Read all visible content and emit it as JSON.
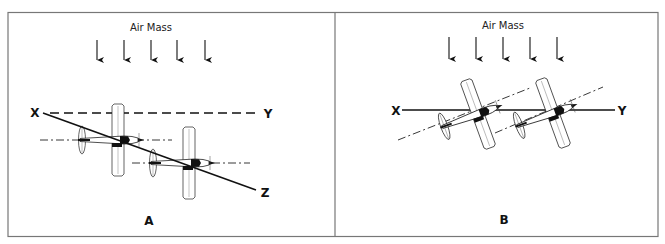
{
  "figure": {
    "panels": [
      {
        "id": "A",
        "letter": "A",
        "air_mass_label": "Air Mass",
        "arrow_count": 5,
        "axis_labels": {
          "start": "X",
          "level_end": "Y",
          "slope_end": "Z"
        },
        "lines": {
          "X-Y": "dashed horizontal reference",
          "X-Z": "solid descending flight path"
        },
        "aircraft_count": 2
      },
      {
        "id": "B",
        "letter": "B",
        "air_mass_label": "Air Mass",
        "arrow_count": 5,
        "axis_labels": {
          "start": "X",
          "level_end": "Y"
        },
        "lines": {
          "X-Y": "solid horizontal flight path"
        },
        "aircraft_count": 2
      }
    ],
    "colors": {
      "line": "#111111",
      "border": "#777777",
      "background": "#ffffff"
    }
  }
}
